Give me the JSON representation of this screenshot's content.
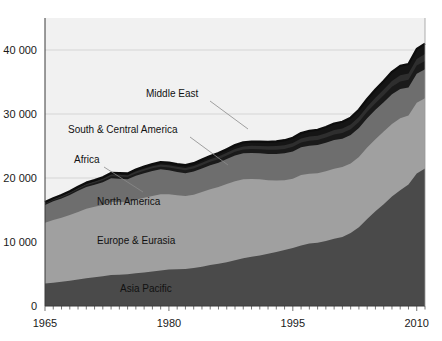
{
  "chart_data": {
    "type": "area",
    "stacked": true,
    "title": "",
    "subtitle": "",
    "xlabel": "",
    "ylabel": "",
    "xlim": [
      1965,
      2011
    ],
    "ylim": [
      0,
      45000
    ],
    "grid": true,
    "gridlines_y": [
      10000,
      20000,
      30000,
      40000
    ],
    "legend_position": "inline-annotations",
    "x_ticks": [
      1965,
      1980,
      1995,
      2010
    ],
    "x_tick_labels": [
      "1965",
      "1980",
      "1995",
      "2010"
    ],
    "y_ticks": [
      0,
      10000,
      20000,
      30000,
      40000
    ],
    "y_tick_labels": [
      "0",
      "10 000",
      "20 000",
      "30 000",
      "40 000"
    ],
    "minor_tick_interval_x": 1,
    "x": [
      1965,
      1966,
      1967,
      1968,
      1969,
      1970,
      1971,
      1972,
      1973,
      1974,
      1975,
      1976,
      1977,
      1978,
      1979,
      1980,
      1981,
      1982,
      1983,
      1984,
      1985,
      1986,
      1987,
      1988,
      1989,
      1990,
      1991,
      1992,
      1993,
      1994,
      1995,
      1996,
      1997,
      1998,
      1999,
      2000,
      2001,
      2002,
      2003,
      2004,
      2005,
      2006,
      2007,
      2008,
      2009,
      2010,
      2011
    ],
    "series": [
      {
        "name": "Asia Pacific",
        "color": "#4a4a4a",
        "label_xy": [
          120,
          292
        ],
        "values": [
          3500,
          3650,
          3800,
          3950,
          4150,
          4350,
          4500,
          4650,
          4850,
          4900,
          4950,
          5100,
          5250,
          5400,
          5550,
          5700,
          5750,
          5800,
          5950,
          6150,
          6400,
          6600,
          6850,
          7150,
          7450,
          7700,
          7900,
          8150,
          8450,
          8750,
          9050,
          9450,
          9750,
          9900,
          10150,
          10500,
          10800,
          11400,
          12300,
          13600,
          14800,
          15900,
          17100,
          18100,
          19000,
          20700,
          21500
        ]
      },
      {
        "name": "Europe & Eurasia",
        "color": "#a0a0a0",
        "label_xy": [
          97,
          244
        ],
        "values": [
          9500,
          9800,
          10000,
          10250,
          10550,
          10850,
          11000,
          11150,
          11400,
          11350,
          11250,
          11500,
          11650,
          11800,
          11900,
          11750,
          11550,
          11400,
          11450,
          11650,
          11850,
          12000,
          12200,
          12350,
          12350,
          12150,
          11900,
          11500,
          11150,
          10900,
          10850,
          11000,
          10900,
          10850,
          10900,
          10950,
          10900,
          10850,
          11000,
          11150,
          11250,
          11350,
          11350,
          11250,
          10750,
          11050,
          10950
        ]
      },
      {
        "name": "North America",
        "color": "#6e6e6e",
        "label_xy": [
          97,
          205
        ],
        "values": [
          2800,
          2900,
          3000,
          3150,
          3300,
          3400,
          3450,
          3550,
          3700,
          3650,
          3600,
          3750,
          3850,
          3900,
          3900,
          3750,
          3650,
          3550,
          3600,
          3700,
          3750,
          3800,
          3900,
          4000,
          4050,
          4050,
          4050,
          4100,
          4150,
          4200,
          4250,
          4350,
          4400,
          4400,
          4450,
          4500,
          4450,
          4450,
          4500,
          4600,
          4600,
          4600,
          4650,
          4550,
          4400,
          4550,
          4550
        ]
      },
      {
        "name": "Africa",
        "color": "#1a1a1a",
        "label_xy": [
          74,
          163
        ],
        "values": [
          180,
          195,
          210,
          225,
          245,
          265,
          280,
          300,
          325,
          335,
          345,
          365,
          385,
          405,
          425,
          440,
          450,
          460,
          480,
          500,
          520,
          540,
          560,
          585,
          605,
          625,
          640,
          660,
          680,
          700,
          720,
          745,
          770,
          790,
          815,
          845,
          870,
          900,
          940,
          990,
          1040,
          1090,
          1140,
          1180,
          1200,
          1260,
          1300
        ]
      },
      {
        "name": "South & Central America",
        "color": "#2e2e2e",
        "label_xy": [
          68,
          133
        ],
        "values": [
          150,
          160,
          175,
          185,
          200,
          215,
          230,
          245,
          265,
          275,
          285,
          300,
          315,
          330,
          345,
          355,
          360,
          365,
          380,
          395,
          410,
          425,
          440,
          460,
          480,
          500,
          515,
          535,
          555,
          575,
          595,
          620,
          645,
          665,
          685,
          710,
          725,
          745,
          775,
          810,
          850,
          890,
          935,
          965,
          970,
          1030,
          1060
        ]
      },
      {
        "name": "Middle East",
        "color": "#151515",
        "label_xy": [
          146,
          97
        ],
        "values": [
          120,
          130,
          145,
          160,
          175,
          190,
          210,
          230,
          255,
          270,
          285,
          305,
          330,
          355,
          380,
          400,
          415,
          430,
          455,
          480,
          505,
          530,
          560,
          595,
          625,
          655,
          680,
          710,
          745,
          780,
          815,
          855,
          895,
          930,
          970,
          1015,
          1050,
          1090,
          1145,
          1210,
          1280,
          1340,
          1410,
          1470,
          1500,
          1580,
          1640
        ]
      }
    ],
    "annotations": [
      {
        "text": "Middle East",
        "x": 146,
        "y": 97,
        "leader": [
          [
            210,
            101
          ],
          [
            248,
            129
          ]
        ]
      },
      {
        "text": "South & Central America",
        "x": 68,
        "y": 133,
        "leader": [
          [
            190,
            137
          ],
          [
            228,
            165
          ]
        ]
      },
      {
        "text": "Africa",
        "x": 74,
        "y": 163,
        "leader": [
          [
            104,
            167
          ],
          [
            143,
            192
          ]
        ]
      },
      {
        "text": "North America",
        "x": 97,
        "y": 205,
        "leader": []
      },
      {
        "text": "Europe & Eurasia",
        "x": 97,
        "y": 244,
        "leader": []
      },
      {
        "text": "Asia Pacific",
        "x": 120,
        "y": 292,
        "leader": []
      }
    ],
    "colors": {
      "background": "#f1f1f1",
      "page": "#ffffff",
      "grid": "#c9c9c9",
      "axis": "#3a3a3a",
      "asia_pacific": "#4a4a4a",
      "europe_eurasia": "#a0a0a0",
      "north_america": "#6e6e6e",
      "africa": "#1a1a1a",
      "south_central_america": "#2e2e2e",
      "middle_east": "#151515"
    },
    "plot_box": {
      "left": 45,
      "right": 425,
      "top": 18,
      "bottom": 306
    }
  }
}
